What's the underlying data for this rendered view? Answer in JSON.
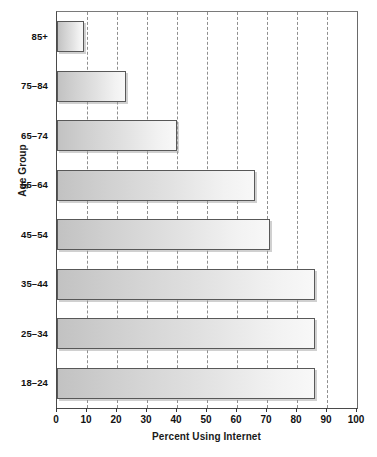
{
  "chart_data": {
    "type": "bar",
    "orientation": "horizontal",
    "title": "",
    "xlabel": "Percent Using Internet",
    "ylabel": "Age Group",
    "categories": [
      "18–24",
      "25–34",
      "35–44",
      "45–54",
      "55–64",
      "65–74",
      "75–84",
      "85+"
    ],
    "values": [
      86,
      86,
      86,
      71,
      66,
      40,
      23,
      9
    ],
    "xlim": [
      0,
      100
    ],
    "xticks": [
      0,
      10,
      20,
      30,
      40,
      50,
      60,
      70,
      80,
      90,
      100
    ],
    "xtick_labels": [
      "0",
      "10",
      "20",
      "30",
      "40",
      "50",
      "60",
      "70",
      "80",
      "90",
      "100"
    ],
    "ytick_labels_top_to_bottom": [
      "85+",
      "75–84",
      "65–74",
      "55–64",
      "45–54",
      "35–44",
      "25–34",
      "18–24"
    ],
    "grid": "vertical-dashed",
    "legend": "none",
    "series": [
      {
        "name": "Percent Using Internet",
        "points": [
          {
            "category": "85+",
            "value": 9
          },
          {
            "category": "75–84",
            "value": 23
          },
          {
            "category": "65–74",
            "value": 40
          },
          {
            "category": "55–64",
            "value": 66
          },
          {
            "category": "45–54",
            "value": 71
          },
          {
            "category": "35–44",
            "value": 86
          },
          {
            "category": "25–34",
            "value": 86
          },
          {
            "category": "18–24",
            "value": 86
          }
        ]
      }
    ],
    "colors": {
      "bar_fill_left": "#c2c2c2",
      "bar_fill_right": "#f8f8f8",
      "bar_border": "#585858",
      "axis": "#3a3a3a",
      "gridline": "#8f8f8f",
      "text": "#111111",
      "background": "#ffffff"
    }
  }
}
